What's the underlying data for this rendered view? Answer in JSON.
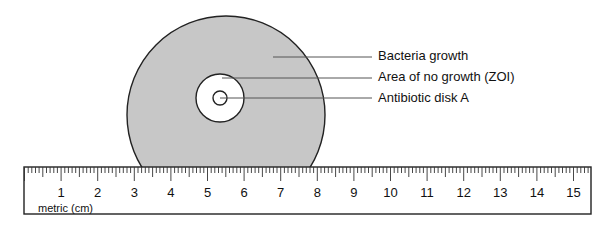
{
  "diagram": {
    "title": "",
    "labels": [
      {
        "text": "Bacteria growth",
        "y": 56
      },
      {
        "text": "Area of no growth (ZOI)",
        "y": 77
      },
      {
        "text": "Antibiotic disk A",
        "y": 98
      }
    ],
    "colors": {
      "bacteria_fill": "#c7c7c7",
      "zoi_fill": "#ffffff",
      "outline": "#222222",
      "leader_line": "#555555"
    }
  },
  "ruler": {
    "unit_label": "metric (cm)",
    "numbers": [
      "1",
      "2",
      "3",
      "4",
      "5",
      "6",
      "7",
      "8",
      "9",
      "10",
      "11",
      "12",
      "13",
      "14",
      "15"
    ],
    "x0": 24.5,
    "cm_px": 36.6
  }
}
